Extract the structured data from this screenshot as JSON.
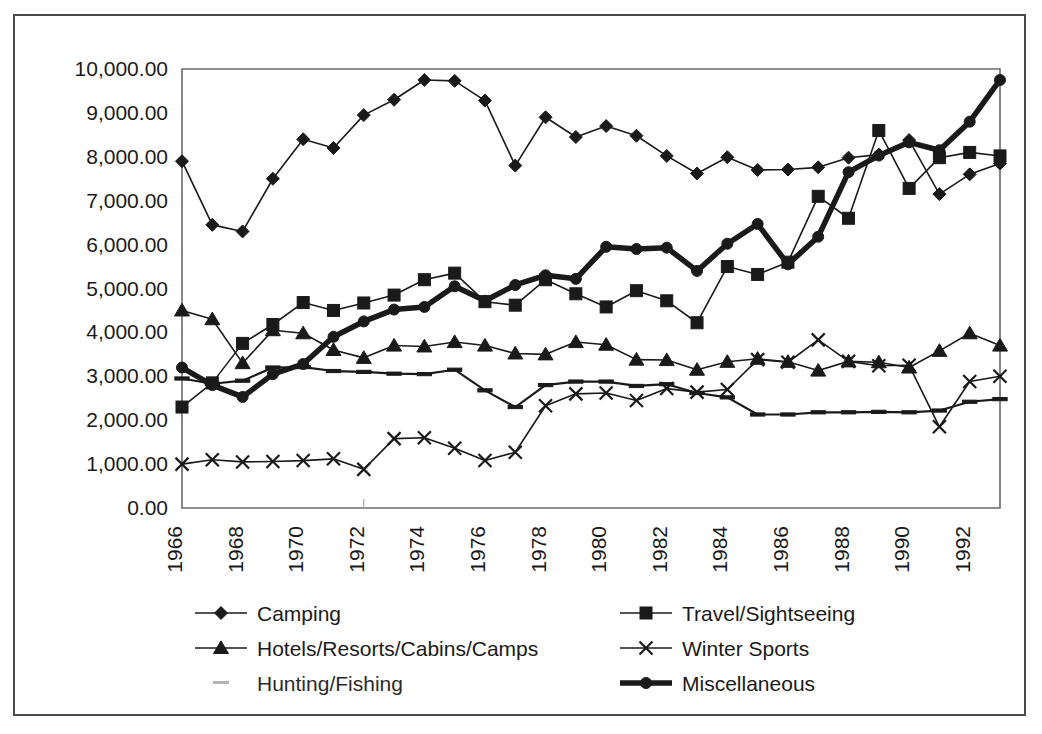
{
  "chart_data": {
    "type": "line",
    "title": "",
    "subtitle": "",
    "xlabel": "",
    "ylabel": "",
    "ylim": [
      0,
      10000
    ],
    "xlim": [
      1966,
      1993
    ],
    "grid": false,
    "legend_position": "bottom",
    "y_ticks": [
      "0.00",
      "1,000.00",
      "2,000.00",
      "3,000.00",
      "4,000.00",
      "5,000.00",
      "6,000.00",
      "7,000.00",
      "8,000.00",
      "9,000.00",
      "10,000.00"
    ],
    "y_tick_values": [
      0,
      1000,
      2000,
      3000,
      4000,
      5000,
      6000,
      7000,
      8000,
      9000,
      10000
    ],
    "x_tick_labels": [
      "1966",
      "1968",
      "1970",
      "1972",
      "1974",
      "1976",
      "1978",
      "1980",
      "1982",
      "1984",
      "1986",
      "1988",
      "1990",
      "1992"
    ],
    "x_tick_values": [
      1966,
      1968,
      1970,
      1972,
      1974,
      1976,
      1978,
      1980,
      1982,
      1984,
      1986,
      1988,
      1990,
      1992
    ],
    "x": [
      1966,
      1967,
      1968,
      1969,
      1970,
      1971,
      1972,
      1973,
      1974,
      1975,
      1976,
      1977,
      1978,
      1979,
      1980,
      1981,
      1982,
      1983,
      1984,
      1985,
      1986,
      1987,
      1988,
      1989,
      1990,
      1991,
      1992,
      1993
    ],
    "series": [
      {
        "name": "Camping",
        "marker": "diamond",
        "color": "#1a1a1a",
        "line_width": 1.6,
        "values": [
          7900,
          6450,
          6300,
          7500,
          8400,
          8200,
          8950,
          9300,
          9750,
          9730,
          9280,
          7800,
          8900,
          8450,
          8700,
          8480,
          8020,
          7620,
          7990,
          7700,
          7710,
          7760,
          7980,
          8050,
          8380,
          7150,
          7600,
          7850
        ]
      },
      {
        "name": "Travel/Sightseeing",
        "marker": "square",
        "color": "#1a1a1a",
        "line_width": 1.6,
        "values": [
          2300,
          2850,
          3750,
          4180,
          4680,
          4500,
          4670,
          4850,
          5200,
          5350,
          4700,
          4620,
          5200,
          4880,
          4580,
          4950,
          4720,
          4220,
          5500,
          5320,
          5600,
          7100,
          6600,
          8600,
          7280,
          7980,
          8100,
          8020
        ]
      },
      {
        "name": "Hotels/Resorts/Cabins/Camps",
        "marker": "triangle",
        "color": "#1a1a1a",
        "line_width": 1.6,
        "values": [
          4500,
          4300,
          3300,
          4050,
          3980,
          3600,
          3420,
          3700,
          3680,
          3780,
          3700,
          3520,
          3500,
          3780,
          3720,
          3380,
          3370,
          3150,
          3330,
          3400,
          3330,
          3130,
          3340,
          3320,
          3200,
          3580,
          3980,
          3700
        ]
      },
      {
        "name": "Winter Sports",
        "marker": "cross",
        "color": "#1a1a1a",
        "line_width": 1.6,
        "values": [
          1000,
          1100,
          1050,
          1060,
          1080,
          1120,
          880,
          1580,
          1600,
          1360,
          1080,
          1270,
          2330,
          2600,
          2620,
          2450,
          2720,
          2640,
          2700,
          3380,
          3320,
          3830,
          3340,
          3240,
          3250,
          1850,
          2880,
          3000
        ]
      },
      {
        "name": "Hunting/Fishing",
        "marker": "dash",
        "color": "#2f2f2f",
        "line_width": 2.2,
        "values": [
          2950,
          2830,
          2900,
          3200,
          3210,
          3120,
          3100,
          3060,
          3050,
          3150,
          2680,
          2300,
          2800,
          2880,
          2880,
          2780,
          2820,
          2620,
          2520,
          2130,
          2130,
          2180,
          2180,
          2190,
          2180,
          2220,
          2420,
          2480
        ]
      },
      {
        "name": "Miscellaneous",
        "marker": "circle",
        "color": "#1a1a1a",
        "line_width": 5.5,
        "values": [
          3200,
          2800,
          2530,
          3050,
          3280,
          3900,
          4250,
          4520,
          4580,
          5050,
          4720,
          5080,
          5300,
          5220,
          5950,
          5900,
          5930,
          5400,
          6020,
          6470,
          5550,
          6180,
          7650,
          8030,
          8330,
          8150,
          8800,
          9750
        ]
      }
    ],
    "legend": [
      {
        "label": "Camping",
        "marker": "diamond",
        "column": "left"
      },
      {
        "label": "Travel/Sightseeing",
        "marker": "square",
        "column": "right"
      },
      {
        "label": "Hotels/Resorts/Cabins/Camps",
        "marker": "triangle",
        "column": "left"
      },
      {
        "label": "Winter Sports",
        "marker": "cross",
        "column": "right"
      },
      {
        "label": "Hunting/Fishing",
        "marker": "dash",
        "column": "left"
      },
      {
        "label": "Miscellaneous",
        "marker": "circle",
        "column": "right"
      }
    ]
  },
  "colors": {
    "background": "#ffffff",
    "frame": "#4a4a4a",
    "axis": "#6b6b6b",
    "ink": "#1a1a1a"
  }
}
